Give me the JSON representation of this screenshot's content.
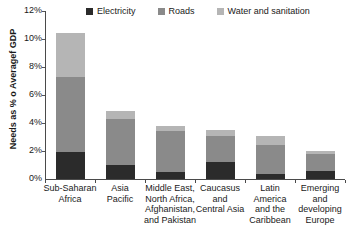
{
  "chart_data": {
    "type": "bar",
    "subtype": "stacked-vertical",
    "title": "",
    "xlabel": "",
    "ylabel": "Needs as % o Averagef GDP",
    "ylim": [
      0,
      12
    ],
    "ytick_labels": [
      "0%",
      "2%",
      "4%",
      "6%",
      "8%",
      "10%",
      "12%"
    ],
    "ytick_values": [
      0,
      2,
      4,
      6,
      8,
      10,
      12
    ],
    "grid": false,
    "legend_position": "top",
    "categories": [
      "Sub-Saharan Africa",
      "Asia Pacific",
      "Middle East, North Africa, Afghanistan, and Pakistan",
      "Caucasus and Central Asia",
      "Latin America and the Caribbean",
      "Emerging and developing Europe"
    ],
    "category_label_lines": [
      [
        "Sub-Saharan",
        "Africa"
      ],
      [
        "Asia",
        "Pacific"
      ],
      [
        "Middle East,",
        "North Africa,",
        "Afghanistan,",
        "and Pakistan"
      ],
      [
        "Caucasus",
        "and",
        "Central Asia"
      ],
      [
        "Latin",
        "America",
        "and the",
        "Caribbean"
      ],
      [
        "Emerging",
        "and",
        "developing",
        "Europe"
      ]
    ],
    "series": [
      {
        "name": "Electricity",
        "color": "#2b2b2b",
        "values": [
          1.9,
          1.0,
          0.5,
          1.2,
          0.35,
          0.6
        ]
      },
      {
        "name": "Roads",
        "color": "#8a8a8a",
        "values": [
          5.4,
          3.3,
          2.9,
          1.9,
          2.1,
          1.2
        ]
      },
      {
        "name": "Water and sanitation",
        "color": "#b5b5b5",
        "values": [
          3.1,
          0.55,
          0.4,
          0.4,
          0.65,
          0.2
        ]
      }
    ],
    "totals": [
      10.4,
      4.85,
      3.8,
      3.5,
      3.1,
      2.0
    ]
  },
  "legend": {
    "items": [
      {
        "label": "Electricity",
        "color": "#2b2b2b"
      },
      {
        "label": "Roads",
        "color": "#8a8a8a"
      },
      {
        "label": "Water and sanitation",
        "color": "#b5b5b5"
      }
    ]
  },
  "footer": {
    "text": ""
  }
}
